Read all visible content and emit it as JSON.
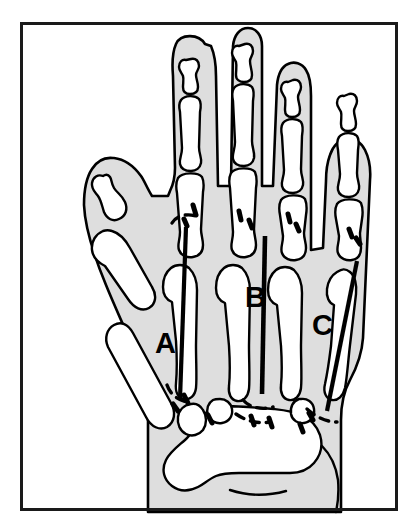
{
  "figure": {
    "type": "anatomical-line-diagram",
    "view": "posteroanterior",
    "title": "",
    "border": {
      "color": "#1a1a1a",
      "x": 20,
      "y": 22,
      "width": 378,
      "height": 489,
      "stroke_width": 3
    },
    "colors": {
      "background": "#ffffff",
      "soft_tissue_fill": "#dedede",
      "bone_fill": "#ffffff",
      "outline": "#000000",
      "measurement_line": "#000000",
      "label_text": "#000000"
    },
    "labels": [
      {
        "id": "label-a",
        "text": "A",
        "x": 155,
        "y": 352,
        "describes": "second-metacarpal-length-line"
      },
      {
        "id": "label-b",
        "text": "B",
        "x": 245,
        "y": 306,
        "describes": "third-metacarpal-length-line"
      },
      {
        "id": "label-c",
        "text": "C",
        "x": 313,
        "y": 334,
        "describes": "fifth-metacarpal-length-line"
      }
    ],
    "measurement_lines": [
      {
        "id": "line-a",
        "label": "A",
        "x1": 186,
        "y1": 228,
        "x2": 180,
        "y2": 398,
        "stroke_width": 4
      },
      {
        "id": "line-b",
        "label": "B",
        "x1": 265,
        "y1": 237,
        "x2": 262,
        "y2": 392,
        "stroke_width": 4
      },
      {
        "id": "line-c",
        "label": "C",
        "x1": 356,
        "y1": 261,
        "x2": 327,
        "y2": 410,
        "stroke_width": 4
      }
    ],
    "structures": [
      {
        "name": "thumb",
        "digit": 1,
        "bones": [
          "distal phalanx",
          "proximal phalanx",
          "first metacarpal"
        ]
      },
      {
        "name": "index finger",
        "digit": 2,
        "bones": [
          "distal phalanx",
          "middle phalanx",
          "proximal phalanx",
          "second metacarpal"
        ]
      },
      {
        "name": "middle finger",
        "digit": 3,
        "bones": [
          "distal phalanx",
          "middle phalanx",
          "proximal phalanx",
          "third metacarpal"
        ]
      },
      {
        "name": "ring finger",
        "digit": 4,
        "bones": [
          "distal phalanx",
          "middle phalanx",
          "proximal phalanx",
          "fourth metacarpal"
        ]
      },
      {
        "name": "little finger",
        "digit": 5,
        "bones": [
          "distal phalanx",
          "middle phalanx",
          "proximal phalanx",
          "fifth metacarpal"
        ]
      },
      {
        "name": "carpus",
        "digit": 0,
        "bones": [
          "carpal bones"
        ]
      }
    ],
    "epiphyseal_markers_count": 12
  }
}
